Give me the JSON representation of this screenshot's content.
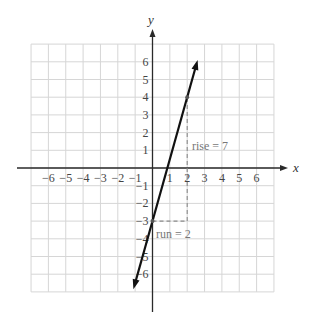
{
  "chart_data": {
    "type": "line",
    "title": "",
    "xlabel": "x",
    "ylabel": "y",
    "xlim": [
      -7,
      7
    ],
    "ylim": [
      -7,
      7
    ],
    "grid": true,
    "x_ticks": [
      -6,
      -5,
      -4,
      -3,
      -2,
      -1,
      1,
      2,
      3,
      4,
      5,
      6
    ],
    "y_ticks": [
      6,
      5,
      4,
      3,
      2,
      1,
      -1,
      -2,
      -3,
      -4,
      -5,
      -6
    ],
    "x_tick_labels": [
      "-6",
      "-5",
      "-4",
      "-3",
      "-2",
      "-1",
      "1",
      "2",
      "3",
      "4",
      "5",
      "6"
    ],
    "y_tick_labels": [
      "6",
      "5",
      "4",
      "3",
      "2",
      "1",
      "-1",
      "-2",
      "-3",
      "-4",
      "-5",
      "-6"
    ],
    "series": [
      {
        "name": "y = 3.5x - 3",
        "slope": 3.5,
        "intercept": -3,
        "x": [
          -1.1,
          2.6
        ],
        "y": [
          -6.85,
          6.1
        ],
        "arrows": "both"
      }
    ],
    "points": [
      {
        "x": 0,
        "y": -3
      },
      {
        "x": 2,
        "y": 4
      }
    ],
    "annotations": [
      {
        "text": "rise = 7",
        "x": 2.15,
        "y": 1.25,
        "refers_to": "vertical dashed segment from (2,-3) to (2,4)"
      },
      {
        "text": "run = 2",
        "x": 0.1,
        "y": -3.7,
        "refers_to": "horizontal dashed segment from (0,-3) to (2,-3)"
      }
    ],
    "slope_triangle": {
      "run_segment": {
        "from": [
          0,
          -3
        ],
        "to": [
          2,
          -3
        ]
      },
      "rise_segment": {
        "from": [
          2,
          -3
        ],
        "to": [
          2,
          4
        ]
      },
      "rise": 7,
      "run": 2
    }
  },
  "labels": {
    "x_axis": "x",
    "y_axis": "y",
    "rise": "rise  =  7",
    "run": "run  =  2"
  },
  "colors": {
    "grid": "#d6d6d6",
    "axes": "#2a2a2a",
    "line": "#111111",
    "dashes": "#8a8a8a",
    "tick_text": "#444444",
    "annotation_text": "#777777"
  }
}
